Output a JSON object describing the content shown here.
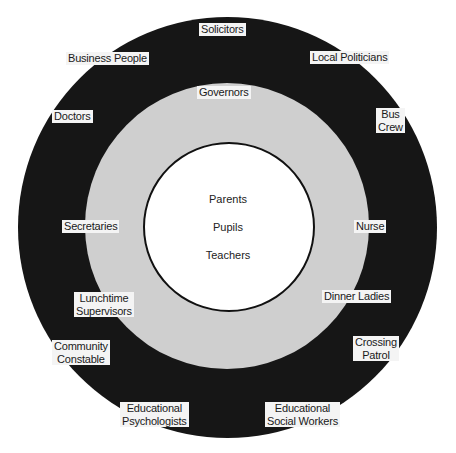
{
  "diagram": {
    "type": "concentric-circles",
    "colors": {
      "outer_ring": "#161616",
      "middle_ring": "#cfcfcf",
      "inner_circle": "#ffffff",
      "inner_border": "#111111",
      "label_bg": "#f4f4f4",
      "label_text": "#1a1a1a"
    },
    "inner": {
      "items": [
        "Parents",
        "Pupils",
        "Teachers"
      ]
    },
    "middle": {
      "items": {
        "governors": "Governors",
        "secretaries": "Secretaries",
        "nurse": "Nurse",
        "lunchtime_supervisors": [
          "Lunchtime",
          "Supervisors"
        ],
        "dinner_ladies": "Dinner Ladies"
      }
    },
    "outer": {
      "items": {
        "solicitors": "Solicitors",
        "business_people": "Business People",
        "local_politicians": "Local Politicians",
        "doctors": "Doctors",
        "bus_crew": [
          "Bus",
          "Crew"
        ],
        "community_constable": [
          "Community",
          "Constable"
        ],
        "crossing_patrol": [
          "Crossing",
          "Patrol"
        ],
        "educational_psychologists": [
          "Educational",
          "Psychologists"
        ],
        "educational_social_workers": [
          "Educational",
          "Social Workers"
        ]
      }
    }
  }
}
